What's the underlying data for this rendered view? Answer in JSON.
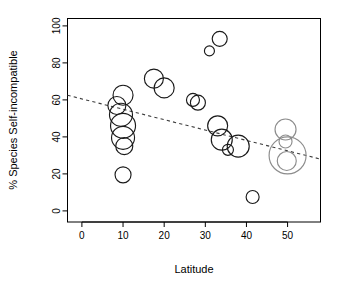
{
  "chart_data": {
    "type": "scatter",
    "title": "",
    "xlabel": "Latitude",
    "ylabel": "% Species Self-incompatible",
    "xlim": [
      -3.5,
      58
    ],
    "ylim": [
      -6,
      104
    ],
    "xticks": [
      0,
      10,
      20,
      30,
      40,
      50
    ],
    "yticks": [
      0,
      20,
      40,
      60,
      80,
      100
    ],
    "grid": false,
    "legend": null,
    "marker_style": "open-circle, area proportional to weight",
    "annotations": [
      "Dashed grey regression line with negative slope"
    ],
    "trendline": {
      "style": "dashed",
      "x": [
        -3.5,
        58
      ],
      "y": [
        62.5,
        28.0
      ],
      "color": "#3d3d3d"
    },
    "points": [
      {
        "x": 8.5,
        "y": 57.0,
        "size": 9.0,
        "color": "#1a1a1a"
      },
      {
        "x": 10.0,
        "y": 62.5,
        "size": 10.0,
        "color": "#1a1a1a"
      },
      {
        "x": 9.5,
        "y": 52.0,
        "size": 11.5,
        "color": "#1a1a1a"
      },
      {
        "x": 10.0,
        "y": 46.0,
        "size": 12.5,
        "color": "#1a1a1a"
      },
      {
        "x": 10.0,
        "y": 39.5,
        "size": 11.5,
        "color": "#1a1a1a"
      },
      {
        "x": 10.3,
        "y": 35.0,
        "size": 8.5,
        "color": "#1a1a1a"
      },
      {
        "x": 10.0,
        "y": 19.5,
        "size": 8.0,
        "color": "#1a1a1a"
      },
      {
        "x": 17.5,
        "y": 71.5,
        "size": 9.5,
        "color": "#1a1a1a"
      },
      {
        "x": 20.0,
        "y": 66.5,
        "size": 10.0,
        "color": "#1a1a1a"
      },
      {
        "x": 27.0,
        "y": 60.0,
        "size": 6.5,
        "color": "#1a1a1a"
      },
      {
        "x": 28.2,
        "y": 58.5,
        "size": 7.5,
        "color": "#1a1a1a"
      },
      {
        "x": 31.0,
        "y": 86.5,
        "size": 5.0,
        "color": "#1a1a1a"
      },
      {
        "x": 33.5,
        "y": 93.0,
        "size": 7.5,
        "color": "#1a1a1a"
      },
      {
        "x": 33.0,
        "y": 46.0,
        "size": 10.0,
        "color": "#1a1a1a"
      },
      {
        "x": 34.0,
        "y": 38.5,
        "size": 10.5,
        "color": "#1a1a1a"
      },
      {
        "x": 35.5,
        "y": 33.0,
        "size": 5.5,
        "color": "#1a1a1a"
      },
      {
        "x": 38.0,
        "y": 35.0,
        "size": 11.0,
        "color": "#1a1a1a"
      },
      {
        "x": 41.5,
        "y": 7.5,
        "size": 6.5,
        "color": "#1a1a1a"
      },
      {
        "x": 49.5,
        "y": 44.0,
        "size": 10.5,
        "color": "#8c8c8c"
      },
      {
        "x": 49.5,
        "y": 37.5,
        "size": 6.5,
        "color": "#8c8c8c"
      },
      {
        "x": 50.0,
        "y": 30.0,
        "size": 18.5,
        "color": "#8c8c8c"
      },
      {
        "x": 49.8,
        "y": 27.0,
        "size": 9.5,
        "color": "#8c8c8c"
      }
    ]
  },
  "axes": {
    "x_label": "Latitude",
    "y_label": "% Species Self-incompatible",
    "x_tick_labels": [
      "0",
      "10",
      "20",
      "30",
      "40",
      "50"
    ],
    "y_tick_labels": [
      "0",
      "20",
      "40",
      "60",
      "80",
      "100"
    ]
  },
  "colors": {
    "bubble_dark": "#1a1a1a",
    "bubble_grey": "#8c8c8c",
    "trendline": "#3d3d3d",
    "axis": "#000000",
    "background": "#ffffff"
  }
}
